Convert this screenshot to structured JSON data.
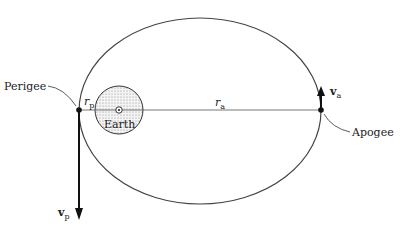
{
  "diagram": {
    "labels": {
      "perigee": "Perigee",
      "apogee": "Apogee",
      "earth": "Earth",
      "r_p": "r",
      "r_p_sub": "p",
      "r_a": "r",
      "r_a_sub": "a",
      "v_p": "v",
      "v_p_sub": "p",
      "v_a": "v",
      "v_a_sub": "a"
    },
    "colors": {
      "stroke": "#333333",
      "earth_fill": "#e6e6e6"
    }
  }
}
